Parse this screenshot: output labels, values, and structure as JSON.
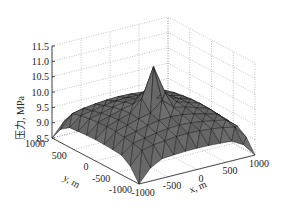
{
  "chart_data": {
    "type": "surface3d",
    "title": "",
    "xlabel": "x, m",
    "ylabel": "y, m",
    "zlabel": "压力, MPa",
    "x_ticks": [
      "-1000",
      "-500",
      "0",
      "500",
      "1000"
    ],
    "y_ticks": [
      "-1000",
      "-500",
      "0",
      "500",
      "1000"
    ],
    "z_ticks": [
      "8.5",
      "9.0",
      "9.5",
      "10.0",
      "10.5",
      "11.0",
      "11.5"
    ],
    "xlim": [
      -1000,
      1000
    ],
    "ylim": [
      -1000,
      1000
    ],
    "zlim": [
      8.5,
      11.5
    ],
    "grid": true,
    "surface_color": "#6e6e6e",
    "edge_color": "#111111",
    "x": [
      -1000,
      -500,
      0,
      500,
      1000
    ],
    "y": [
      -1000,
      -500,
      0,
      500,
      1000
    ],
    "z": [
      [
        8.5,
        9.4,
        9.5,
        9.4,
        8.5
      ],
      [
        9.4,
        9.9,
        10.1,
        9.9,
        9.4
      ],
      [
        9.5,
        10.1,
        11.1,
        10.1,
        9.5
      ],
      [
        9.4,
        9.9,
        10.1,
        9.9,
        9.4
      ],
      [
        8.5,
        9.4,
        9.5,
        9.4,
        8.5
      ]
    ]
  }
}
